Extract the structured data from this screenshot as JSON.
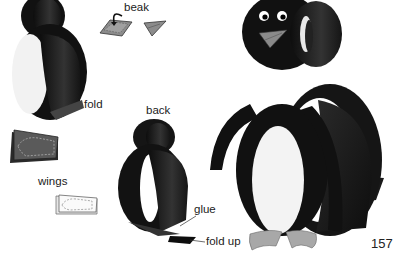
{
  "page": {
    "number": "157"
  },
  "labels": {
    "beak": "beak",
    "fold": "fold",
    "back": "back",
    "wings": "wings",
    "glue": "glue",
    "fold_up": "fold up"
  },
  "colors": {
    "body_black": "#1a1a1a",
    "body_dark": "#2b2b2b",
    "belly_white": "#f4f4f4",
    "beak_gray": "#8a8a8a",
    "feet_gray": "#a6a6a6",
    "wing_gray": "#555555",
    "text": "#222222"
  },
  "illustrations": [
    {
      "name": "front-ring-assembly",
      "description": "two black paper rings with white inner lining, front view"
    },
    {
      "name": "beak-fold-steps",
      "description": "gray beak folding diagram with arrow"
    },
    {
      "name": "wing-black-template",
      "description": "black wing rectangle with dashed cut line"
    },
    {
      "name": "wing-white-template",
      "description": "white wing rectangle with dashed cut line"
    },
    {
      "name": "back-ring-assembly",
      "description": "two black paper rings, back view"
    },
    {
      "name": "finished-penguin",
      "description": "completed paper-ring penguin with eyes, beak, wings and feet"
    }
  ]
}
